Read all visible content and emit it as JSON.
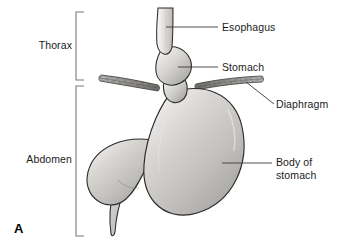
{
  "figure": {
    "panel_letter": "A",
    "width": 344,
    "height": 251,
    "background_color": "#ffffff"
  },
  "region_brackets": [
    {
      "id": "thorax",
      "label": "Thorax",
      "top": 12,
      "bottom": 80
    },
    {
      "id": "abdomen",
      "label": "Abdomen",
      "top": 86,
      "bottom": 236
    }
  ],
  "callouts": [
    {
      "id": "esophagus",
      "label": "Esophagus",
      "lines": [
        "Esophagus"
      ],
      "leader": "horizontal"
    },
    {
      "id": "stomach",
      "label": "Stomach",
      "lines": [
        "Stomach"
      ],
      "leader": "horizontal"
    },
    {
      "id": "diaphragm",
      "label": "Diaphragm",
      "lines": [
        "Diaphragm"
      ],
      "leader": "diagonal"
    },
    {
      "id": "body-of-stomach",
      "label": "Body of stomach",
      "lines": [
        "Body of",
        "stomach"
      ],
      "leader": "horizontal"
    }
  ],
  "label_text": {
    "thorax": "Thorax",
    "abdomen": "Abdomen",
    "esophagus": "Esophagus",
    "stomach": "Stomach",
    "diaphragm": "Diaphragm",
    "body_of_stomach_line1": "Body of",
    "body_of_stomach_line2": "stomach",
    "panel_letter": "A"
  },
  "colors": {
    "organ_fill_light": "#f2f1ef",
    "organ_fill_mid": "#c9c7c4",
    "organ_fill_dark": "#9a9896",
    "organ_outline": "#2b2b2b",
    "diaphragm_fill": "#8e8c89",
    "diaphragm_outline": "#3a3a3a",
    "leader_line": "#3a3a3a",
    "bracket_line": "#7a7a7a",
    "text": "#1b1b1b",
    "background": "#ffffff"
  }
}
